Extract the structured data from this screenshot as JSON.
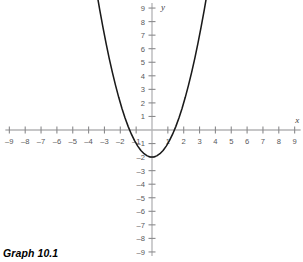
{
  "caption": {
    "text": "Graph 10.1"
  },
  "colors": {
    "background": "#ffffff",
    "axis": "#b3b3b5",
    "tick_mark": "#8a8a8c",
    "tick_label": "#58585a",
    "curve": "#1a1a1a",
    "axis_name": "#3d3d3f",
    "caption": "#000000"
  },
  "chart_data": {
    "type": "line",
    "title": "Graph 10.1",
    "xlabel": "x",
    "ylabel": "y",
    "xlim": [
      -9,
      9
    ],
    "ylim": [
      -9,
      9
    ],
    "grid": false,
    "legend": "none",
    "equation": "y = x^2 - 2",
    "vertex": [
      0,
      -2
    ],
    "x_intercepts": [
      -1.41,
      1.41
    ],
    "y_intercept": -2,
    "xticks": [
      -9,
      -8,
      -7,
      -6,
      -5,
      -4,
      -3,
      -2,
      -1,
      1,
      2,
      3,
      4,
      5,
      6,
      7,
      8,
      9
    ],
    "yticks": [
      9,
      8,
      7,
      6,
      5,
      4,
      3,
      2,
      1,
      -1,
      -2,
      -3,
      -4,
      -5,
      -6,
      -7,
      -8,
      -9
    ],
    "xtick_labels": [
      "–9",
      "–8",
      "–7",
      "–6",
      "–5",
      "–4",
      "–3",
      "–2",
      "–1",
      "1",
      "2",
      "3",
      "4",
      "5",
      "6",
      "7",
      "8",
      "9"
    ],
    "ytick_labels": [
      "9",
      "8",
      "7",
      "6",
      "5",
      "4",
      "3",
      "2",
      "1",
      "–1",
      "–2",
      "–3",
      "–4",
      "–5",
      "–6",
      "–7",
      "–8",
      "–9"
    ],
    "series": [
      {
        "name": "y = x^2 - 2",
        "x": [
          -3.45,
          -3.3,
          -3.1,
          -2.9,
          -2.7,
          -2.5,
          -2.3,
          -2.1,
          -1.9,
          -1.7,
          -1.5,
          -1.3,
          -1.1,
          -0.9,
          -0.7,
          -0.5,
          -0.3,
          -0.1,
          0,
          0.1,
          0.3,
          0.5,
          0.7,
          0.9,
          1.1,
          1.3,
          1.5,
          1.7,
          1.9,
          2.1,
          2.3,
          2.5,
          2.7,
          2.9,
          3.1,
          3.3,
          3.45
        ],
        "y": [
          9.9,
          8.89,
          7.61,
          6.41,
          5.29,
          4.25,
          3.29,
          2.41,
          1.61,
          0.89,
          0.25,
          -0.31,
          -0.79,
          -1.19,
          -1.51,
          -1.75,
          -1.91,
          -1.99,
          -2,
          -1.99,
          -1.91,
          -1.75,
          -1.51,
          -1.19,
          -0.79,
          -0.31,
          0.25,
          0.89,
          1.61,
          2.41,
          3.29,
          4.25,
          5.29,
          6.41,
          7.61,
          8.89,
          9.9
        ]
      }
    ]
  }
}
